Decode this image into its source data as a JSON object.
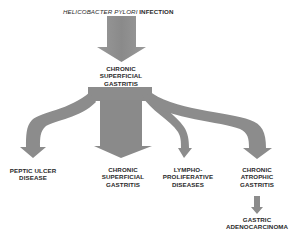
{
  "diagram": {
    "title": {
      "organism": "HELICOBACTER PYLORI",
      "suffix": "INFECTION"
    },
    "nodes": {
      "root": {
        "lines": [
          "CHRONIC",
          "SUPERFICIAL",
          "GASTRITIS"
        ]
      },
      "peptic_ulcer": {
        "lines": [
          "PEPTIC ULCER",
          "DISEASE"
        ]
      },
      "chronic_superficial": {
        "lines": [
          "CHRONIC",
          "SUPERFICIAL",
          "GASTRITIS"
        ]
      },
      "lymphoproliferative": {
        "lines": [
          "LYMPHO-",
          "PROLIFERATIVE",
          "DISEASES"
        ]
      },
      "chronic_atrophic": {
        "lines": [
          "CHRONIC",
          "ATROPHIC",
          "GASTRITIS"
        ]
      },
      "gastric_adenocarcinoma": {
        "lines": [
          "GASTRIC",
          "ADENOCARCINOMA"
        ]
      }
    },
    "edges": [
      {
        "from": "infection",
        "to": "root"
      },
      {
        "from": "root",
        "to": "peptic_ulcer"
      },
      {
        "from": "root",
        "to": "chronic_superficial"
      },
      {
        "from": "root",
        "to": "lymphoproliferative"
      },
      {
        "from": "root",
        "to": "chronic_atrophic"
      },
      {
        "from": "chronic_atrophic",
        "to": "gastric_adenocarcinoma"
      }
    ],
    "colors": {
      "arrow": "#8c8c8c",
      "text": "#2a2a2a"
    }
  }
}
